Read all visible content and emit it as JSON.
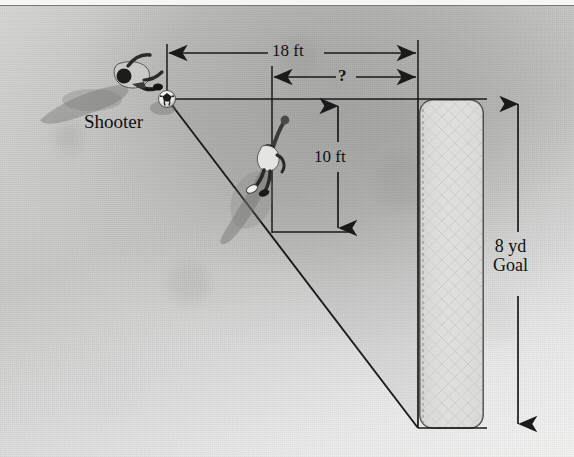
{
  "figure": {
    "scene": "overhead photograph of a soccer pitch with goal, shooter and goalkeeper"
  },
  "labels": {
    "shooter": "Shooter",
    "width_18ft": "18 ft",
    "unknown": "?",
    "height_10ft": "10 ft",
    "goal_line1": "8 yd",
    "goal_line2": "Goal"
  },
  "measurements": [
    {
      "name": "top-width",
      "value": "18 ft",
      "orientation": "horizontal"
    },
    {
      "name": "inner-width-unknown",
      "value": "?",
      "orientation": "horizontal"
    },
    {
      "name": "keeper-offset",
      "value": "10 ft",
      "orientation": "vertical"
    },
    {
      "name": "goal-width",
      "value": "8 yd",
      "orientation": "vertical"
    }
  ],
  "colors": {
    "line": "#1a1a1a",
    "field_light": "#e9e9e7",
    "field_mid": "#c9c9c7",
    "net": "#dcdcda",
    "text": "#111111"
  },
  "annotations": {
    "shot_line": "diagonal shot path from ball to far goalpost",
    "goal_net": "rounded rectangle representing goal net",
    "keeper": "goalkeeper figure with arms raised"
  }
}
